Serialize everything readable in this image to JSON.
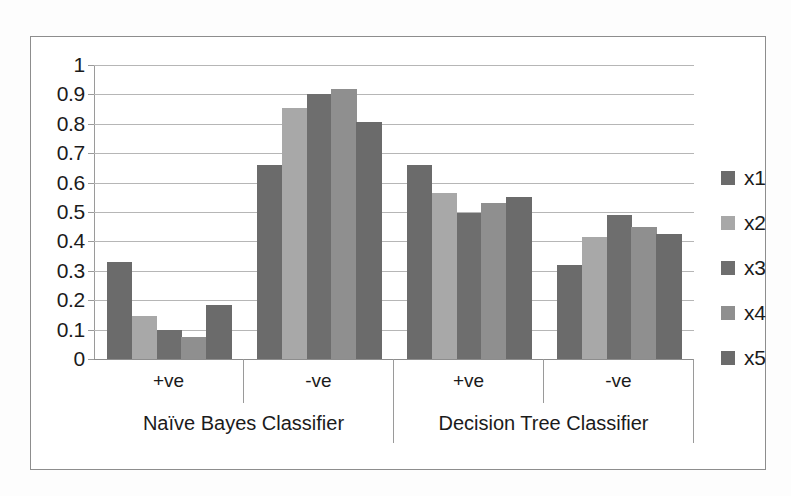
{
  "chart_data": {
    "type": "bar",
    "title": "",
    "xlabel": "",
    "ylabel": "",
    "ylim": [
      0,
      1
    ],
    "ytick_labels": [
      "1",
      "0.9",
      "0.8",
      "0.7",
      "0.6",
      "0.5",
      "0.4",
      "0.3",
      "0.2",
      "0.1",
      "0"
    ],
    "ytick_values": [
      1,
      0.9,
      0.8,
      0.7,
      0.6,
      0.5,
      0.4,
      0.3,
      0.2,
      0.1,
      0
    ],
    "grid": true,
    "legend_position": "right",
    "group_labels": [
      "Naïve Bayes Classifier",
      "Decision Tree Classifier"
    ],
    "categories": [
      "+ve",
      "-ve",
      "+ve",
      "-ve"
    ],
    "category_group_map": [
      0,
      0,
      1,
      1
    ],
    "series": [
      {
        "name": "x1",
        "color": "#6b6b6b",
        "values": [
          0.33,
          0.66,
          0.66,
          0.32
        ]
      },
      {
        "name": "x2",
        "color": "#a8a8a8",
        "values": [
          0.145,
          0.855,
          0.565,
          0.415
        ]
      },
      {
        "name": "x3",
        "color": "#6e6e6e",
        "values": [
          0.1,
          0.9,
          0.495,
          0.49
        ]
      },
      {
        "name": "x4",
        "color": "#8f8f8f",
        "values": [
          0.075,
          0.92,
          0.53,
          0.45
        ]
      },
      {
        "name": "x5",
        "color": "#6b6b6b",
        "values": [
          0.185,
          0.805,
          0.55,
          0.425
        ]
      }
    ]
  },
  "legend": {
    "items": [
      {
        "label": "x1",
        "color": "#6b6b6b"
      },
      {
        "label": "x2",
        "color": "#a8a8a8"
      },
      {
        "label": "x3",
        "color": "#6e6e6e"
      },
      {
        "label": "x4",
        "color": "#8f8f8f"
      },
      {
        "label": "x5",
        "color": "#6b6b6b"
      }
    ]
  },
  "colors": {
    "frame_border": "#8d8d8d",
    "gridline": "#b6b6b6",
    "axis": "#9a9a9a",
    "text": "#1b1b1b",
    "plot_background": "#ffffff"
  }
}
